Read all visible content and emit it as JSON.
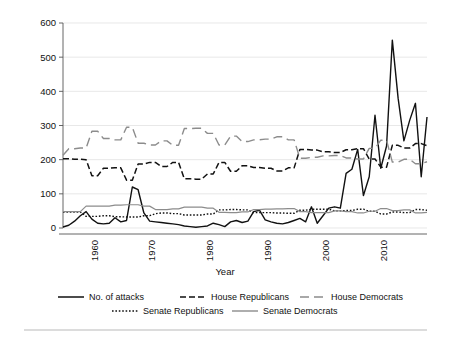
{
  "figure": {
    "name": "political-attacks-and-party-seats-chart",
    "background": "#ffffff",
    "bottom_rule": true
  },
  "chart_data": {
    "type": "line",
    "title": "",
    "xlabel": "Year",
    "ylabel": "",
    "xlim": [
      1954,
      2017
    ],
    "ylim": [
      0,
      600
    ],
    "yticks": [
      0,
      100,
      200,
      300,
      400,
      500,
      600
    ],
    "xticks": [
      1960,
      1970,
      1980,
      1990,
      2000,
      2010
    ],
    "xtick_rotation": 90,
    "grid": "horizontal",
    "legend_position": "bottom",
    "x": [
      1954,
      1955,
      1956,
      1957,
      1958,
      1959,
      1960,
      1961,
      1962,
      1963,
      1964,
      1965,
      1966,
      1967,
      1968,
      1969,
      1970,
      1971,
      1972,
      1973,
      1974,
      1975,
      1976,
      1977,
      1978,
      1979,
      1980,
      1981,
      1982,
      1983,
      1984,
      1985,
      1986,
      1987,
      1988,
      1989,
      1990,
      1991,
      1992,
      1993,
      1994,
      1995,
      1996,
      1997,
      1998,
      1999,
      2000,
      2001,
      2002,
      2003,
      2004,
      2005,
      2006,
      2007,
      2008,
      2009,
      2010,
      2011,
      2012,
      2013,
      2014,
      2015,
      2016,
      2017
    ],
    "series": [
      {
        "name": "No. of attacks",
        "style": "solid",
        "color": "#111111",
        "width": 1.4,
        "values": [
          3,
          8,
          20,
          36,
          48,
          26,
          14,
          12,
          14,
          30,
          18,
          22,
          120,
          112,
          44,
          20,
          18,
          16,
          14,
          12,
          10,
          6,
          4,
          2,
          4,
          6,
          14,
          10,
          4,
          18,
          22,
          16,
          20,
          48,
          52,
          24,
          18,
          14,
          12,
          16,
          22,
          28,
          18,
          62,
          14,
          36,
          58,
          62,
          58,
          160,
          172,
          230,
          95,
          150,
          330,
          175,
          240,
          550,
          380,
          255,
          315,
          365,
          150,
          325
        ]
      },
      {
        "name": "House Republicans",
        "style": "dashed",
        "color": "#111111",
        "width": 1.5,
        "values": [
          203,
          203,
          201,
          201,
          200,
          153,
          153,
          175,
          175,
          176,
          176,
          140,
          140,
          187,
          187,
          192,
          192,
          180,
          180,
          192,
          192,
          144,
          144,
          143,
          143,
          158,
          158,
          192,
          192,
          166,
          166,
          182,
          182,
          177,
          177,
          175,
          175,
          167,
          167,
          176,
          176,
          230,
          230,
          228,
          228,
          223,
          223,
          221,
          221,
          229,
          229,
          232,
          232,
          202,
          202,
          178,
          178,
          242,
          242,
          234,
          234,
          247,
          247,
          241
        ]
      },
      {
        "name": "House Democrats",
        "style": "longdash",
        "color": "#8c8c8c",
        "width": 1.4,
        "values": [
          213,
          232,
          232,
          234,
          234,
          283,
          283,
          262,
          262,
          258,
          258,
          295,
          295,
          248,
          248,
          243,
          243,
          255,
          255,
          242,
          242,
          291,
          291,
          292,
          292,
          277,
          277,
          243,
          243,
          269,
          269,
          253,
          253,
          258,
          258,
          260,
          260,
          267,
          267,
          258,
          258,
          204,
          204,
          207,
          207,
          211,
          211,
          212,
          212,
          205,
          205,
          202,
          202,
          233,
          233,
          257,
          257,
          193,
          193,
          201,
          201,
          188,
          188,
          194
        ]
      },
      {
        "name": "Senate Republicans",
        "style": "dotted",
        "color": "#111111",
        "width": 1.4,
        "values": [
          47,
          47,
          47,
          47,
          34,
          34,
          34,
          36,
          36,
          33,
          33,
          32,
          32,
          32,
          36,
          36,
          42,
          44,
          44,
          42,
          42,
          38,
          38,
          38,
          38,
          41,
          41,
          53,
          53,
          54,
          54,
          53,
          53,
          45,
          45,
          45,
          45,
          44,
          44,
          43,
          43,
          52,
          52,
          55,
          55,
          55,
          55,
          50,
          50,
          51,
          51,
          55,
          55,
          49,
          49,
          41,
          41,
          47,
          47,
          45,
          45,
          54,
          54,
          52
        ]
      },
      {
        "name": "Senate Democrats",
        "style": "solid-gray",
        "color": "#8c8c8c",
        "width": 1.2,
        "values": [
          48,
          48,
          48,
          48,
          64,
          64,
          64,
          64,
          64,
          67,
          67,
          68,
          68,
          68,
          64,
          64,
          54,
          54,
          54,
          56,
          56,
          61,
          61,
          61,
          61,
          58,
          58,
          46,
          46,
          45,
          45,
          47,
          47,
          54,
          54,
          55,
          55,
          56,
          56,
          57,
          57,
          48,
          48,
          45,
          45,
          45,
          45,
          50,
          50,
          48,
          48,
          44,
          44,
          49,
          49,
          57,
          57,
          51,
          51,
          53,
          53,
          44,
          44,
          46
        ]
      }
    ],
    "legend": [
      {
        "label": "No. of attacks",
        "style": "solid",
        "color": "#111111"
      },
      {
        "label": "House Republicans",
        "style": "dashed",
        "color": "#111111"
      },
      {
        "label": "House Democrats",
        "style": "longdash",
        "color": "#8c8c8c"
      },
      {
        "label": "Senate Republicans",
        "style": "dotted",
        "color": "#111111"
      },
      {
        "label": "Senate Democrats",
        "style": "solid-gray",
        "color": "#8c8c8c"
      }
    ]
  }
}
